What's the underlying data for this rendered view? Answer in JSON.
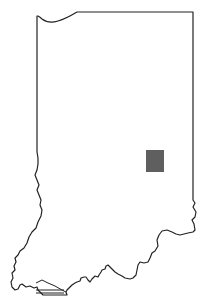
{
  "map": {
    "region": "Indiana",
    "type": "locator map",
    "highlight": {
      "shape": "rectangle",
      "color": "#5f5f5f",
      "x": 146,
      "y": 150,
      "width": 18,
      "height": 22
    },
    "outline_color": "#222222",
    "background": "#ffffff"
  }
}
